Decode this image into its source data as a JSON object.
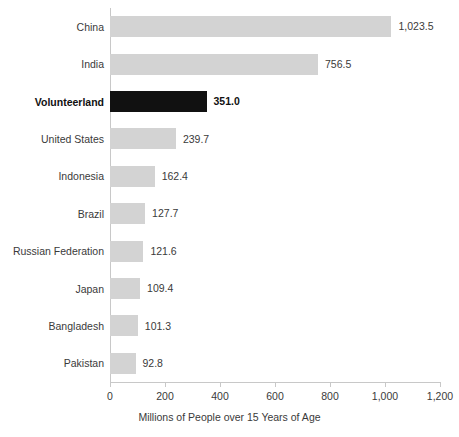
{
  "chart_data": {
    "type": "bar",
    "orientation": "horizontal",
    "title": "",
    "subtitle": "",
    "xlabel": "Millions of People over 15 Years of Age",
    "ylabel": "",
    "xlim": [
      0,
      1200
    ],
    "xticks": [
      0,
      200,
      400,
      600,
      800,
      1000,
      1200
    ],
    "xtick_labels": [
      "0",
      "200",
      "400",
      "600",
      "800",
      "1,000",
      "1,200"
    ],
    "grid": false,
    "legend": null,
    "categories": [
      "China",
      "India",
      "Volunteerland",
      "United States",
      "Indonesia",
      "Brazil",
      "Russian Federation",
      "Japan",
      "Bangladesh",
      "Pakistan"
    ],
    "values": [
      1023.5,
      756.5,
      351.0,
      239.7,
      162.4,
      127.7,
      121.6,
      109.4,
      101.3,
      92.8
    ],
    "value_labels": [
      "1,023.5",
      "756.5",
      "351.0",
      "239.7",
      "162.4",
      "127.7",
      "121.6",
      "109.4",
      "101.3",
      "92.8"
    ],
    "highlight_category": "Volunteerland",
    "highlight_index": 2,
    "colors": {
      "bar": "#d3d3d3",
      "bar_highlight": "#111111",
      "text": "#3a3a3a",
      "axis": "#c8c8c8",
      "background": "#ffffff"
    }
  }
}
